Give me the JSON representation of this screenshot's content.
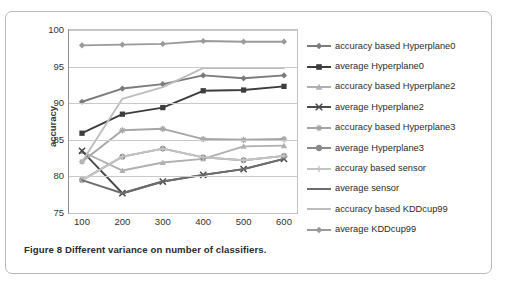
{
  "figure": {
    "caption": "Figure 8 Different variance on number of classifiers."
  },
  "chart_data": {
    "type": "line",
    "title": "",
    "xlabel": "",
    "ylabel": "accuracy",
    "categories": [
      "100",
      "200",
      "300",
      "400",
      "500",
      "600"
    ],
    "ylim": [
      75,
      100
    ],
    "yticks": [
      "75",
      "80",
      "85",
      "90",
      "95",
      "100"
    ],
    "grid": true,
    "legend_position": "right",
    "series": [
      {
        "name": "accuracy based Hyperplane0",
        "marker": "diamond",
        "color": "#7b7b7b",
        "values": [
          90.2,
          92.0,
          92.6,
          93.8,
          93.4,
          93.8
        ]
      },
      {
        "name": "average Hyperplane0",
        "marker": "square",
        "color": "#3d3d3d",
        "values": [
          85.9,
          88.5,
          89.4,
          91.7,
          91.8,
          92.3
        ]
      },
      {
        "name": "accuracy based Hyperplane2",
        "marker": "triangle",
        "color": "#b0b0b0",
        "values": [
          83.4,
          80.8,
          81.9,
          82.4,
          84.1,
          84.2
        ]
      },
      {
        "name": "average Hyperplane2",
        "marker": "x",
        "color": "#4a4a4a",
        "values": [
          83.5,
          77.7,
          79.3,
          80.2,
          81.0,
          82.4
        ]
      },
      {
        "name": "accuracy based Hyperplane3",
        "marker": "asterisk",
        "color": "#a6a6a6",
        "values": [
          82.0,
          86.3,
          86.5,
          85.1,
          85.0,
          85.1
        ]
      },
      {
        "name": "average Hyperplane3",
        "marker": "circle",
        "color": "#8a8a8a",
        "values": [
          79.5,
          82.7,
          83.8,
          82.6,
          82.2,
          82.8
        ]
      },
      {
        "name": "accuray based sensor",
        "marker": "plus",
        "color": "#c4c4c4",
        "values": [
          79.5,
          82.7,
          83.8,
          82.6,
          82.2,
          82.8
        ]
      },
      {
        "name": "average sensor",
        "marker": "none",
        "color": "#6d6d6d",
        "values": [
          79.5,
          77.7,
          79.3,
          80.2,
          81.0,
          82.4
        ]
      },
      {
        "name": "accuracy based KDDcup99",
        "marker": "none",
        "color": "#bdbdbd",
        "values": [
          82.0,
          90.6,
          92.2,
          94.8,
          94.8,
          94.8
        ]
      },
      {
        "name": "average KDDcup99",
        "marker": "diamond",
        "color": "#9a9a9a",
        "values": [
          97.9,
          98.0,
          98.1,
          98.5,
          98.4,
          98.4
        ]
      }
    ]
  }
}
